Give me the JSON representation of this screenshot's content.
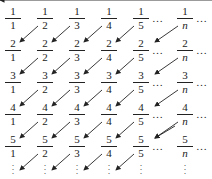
{
  "diagram": {
    "columns": [
      "1",
      "2",
      "3",
      "4",
      "5",
      "n"
    ],
    "rows": [
      "1",
      "2",
      "3",
      "4",
      "5"
    ],
    "cells": [
      [
        {
          "num": "1",
          "den": "1"
        },
        {
          "num": "1",
          "den": "2"
        },
        {
          "num": "1",
          "den": "3"
        },
        {
          "num": "1",
          "den": "4"
        },
        {
          "num": "1",
          "den": "5"
        },
        {
          "num": "1",
          "den": "n"
        }
      ],
      [
        {
          "num": "2",
          "den": "1"
        },
        {
          "num": "2",
          "den": "2"
        },
        {
          "num": "2",
          "den": "3"
        },
        {
          "num": "2",
          "den": "4"
        },
        {
          "num": "2",
          "den": "5"
        },
        {
          "num": "2",
          "den": "n"
        }
      ],
      [
        {
          "num": "3",
          "den": "1"
        },
        {
          "num": "3",
          "den": "2"
        },
        {
          "num": "3",
          "den": "3"
        },
        {
          "num": "3",
          "den": "4"
        },
        {
          "num": "3",
          "den": "5"
        },
        {
          "num": "3",
          "den": "n"
        }
      ],
      [
        {
          "num": "4",
          "den": "1"
        },
        {
          "num": "4",
          "den": "2"
        },
        {
          "num": "4",
          "den": "3"
        },
        {
          "num": "4",
          "den": "4"
        },
        {
          "num": "4",
          "den": "5"
        },
        {
          "num": "4",
          "den": "n"
        }
      ],
      [
        {
          "num": "5",
          "den": "1"
        },
        {
          "num": "5",
          "den": "2"
        },
        {
          "num": "5",
          "den": "3"
        },
        {
          "num": "5",
          "den": "4"
        },
        {
          "num": "5",
          "den": "5"
        },
        {
          "num": "5",
          "den": "n"
        }
      ]
    ],
    "hdots": "…",
    "vdots": "⋮",
    "arrow_color": "#222222"
  }
}
